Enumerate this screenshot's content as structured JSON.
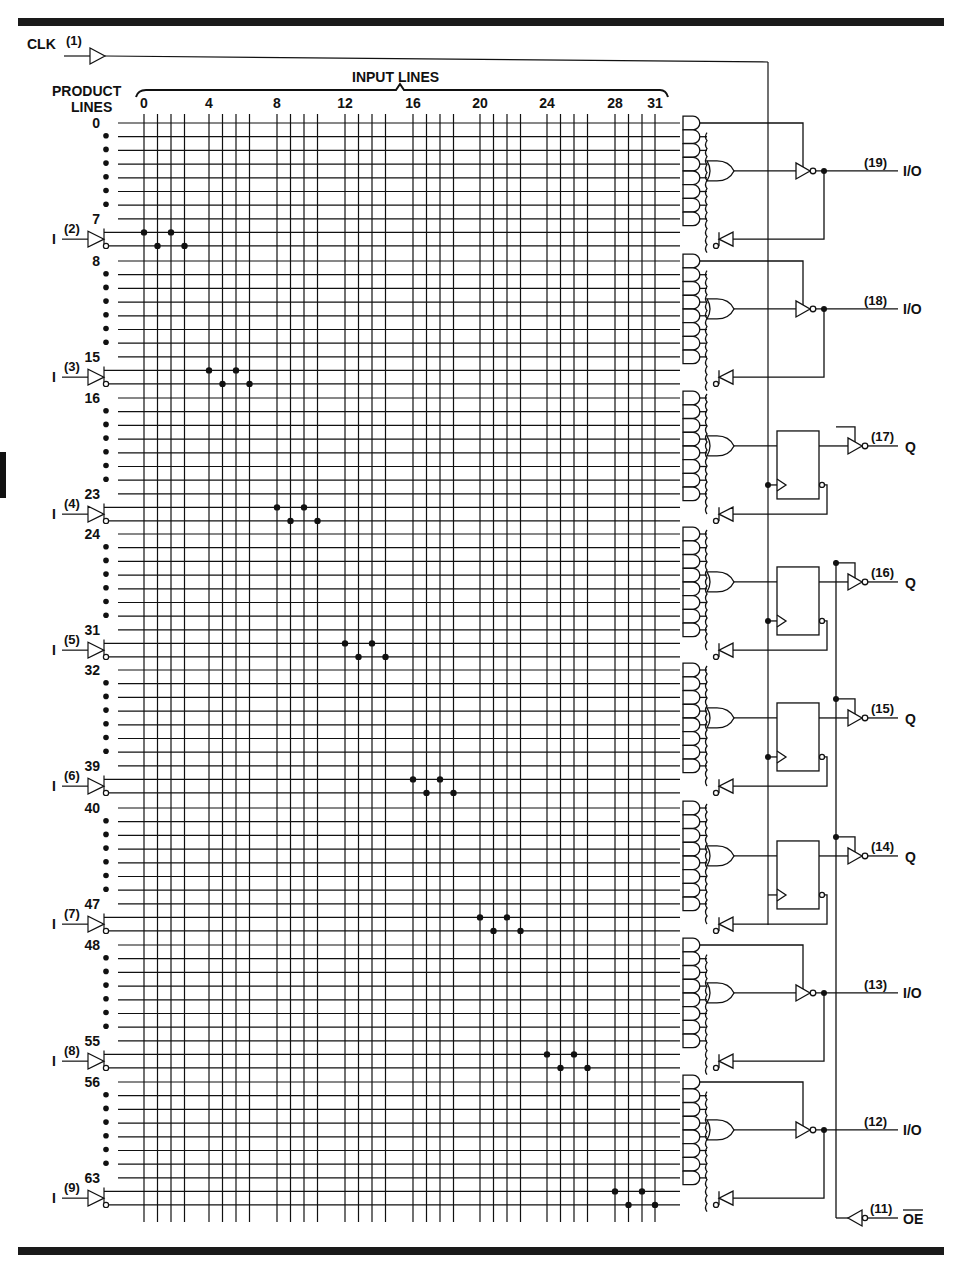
{
  "diagram": {
    "clock": {
      "label": "CLK",
      "pin": "(1)"
    },
    "header": {
      "product_lines_label_1": "PRODUCT",
      "product_lines_label_2": "LINES",
      "input_lines_label": "INPUT LINES",
      "input_ticks": [
        "0",
        "4",
        "8",
        "12",
        "16",
        "20",
        "24",
        "28",
        "31"
      ]
    },
    "product_line_groups": [
      {
        "start": "0",
        "end": "7"
      },
      {
        "start": "8",
        "end": "15"
      },
      {
        "start": "16",
        "end": "23"
      },
      {
        "start": "24",
        "end": "31"
      },
      {
        "start": "32",
        "end": "39"
      },
      {
        "start": "40",
        "end": "47"
      },
      {
        "start": "48",
        "end": "55"
      },
      {
        "start": "56",
        "end": "63"
      }
    ],
    "inputs": [
      {
        "label": "I",
        "pin": "(2)"
      },
      {
        "label": "I",
        "pin": "(3)"
      },
      {
        "label": "I",
        "pin": "(4)"
      },
      {
        "label": "I",
        "pin": "(5)"
      },
      {
        "label": "I",
        "pin": "(6)"
      },
      {
        "label": "I",
        "pin": "(7)"
      },
      {
        "label": "I",
        "pin": "(8)"
      },
      {
        "label": "I",
        "pin": "(9)"
      }
    ],
    "outputs": [
      {
        "pin": "(19)",
        "label": "I/O",
        "type": "combinational"
      },
      {
        "pin": "(18)",
        "label": "I/O",
        "type": "combinational"
      },
      {
        "pin": "(17)",
        "label": "Q",
        "type": "registered"
      },
      {
        "pin": "(16)",
        "label": "Q",
        "type": "registered"
      },
      {
        "pin": "(15)",
        "label": "Q",
        "type": "registered"
      },
      {
        "pin": "(14)",
        "label": "Q",
        "type": "registered"
      },
      {
        "pin": "(13)",
        "label": "I/O",
        "type": "combinational"
      },
      {
        "pin": "(12)",
        "label": "I/O",
        "type": "combinational"
      }
    ],
    "register": {
      "d_label": "1D",
      "clk_label": "C1"
    },
    "output_enable": {
      "pin": "(11)",
      "label": "OE"
    }
  }
}
